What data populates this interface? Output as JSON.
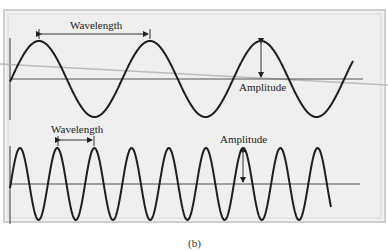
{
  "figure": {
    "caption": "(b)",
    "background": "#ffffff",
    "panel_fill": "#efefef",
    "frame_color": "#c8c8c8",
    "wave_color": "#1e1e1e",
    "baseline_color": "#555555"
  },
  "top_wave": {
    "wavelength_label": "Wavelength",
    "amplitude_label": "Amplitude",
    "baseline_y": 79,
    "amplitude_px": 38,
    "period_px": 111,
    "start_x": 10,
    "end_x": 353,
    "phase_peak_x": 39
  },
  "bottom_wave": {
    "wavelength_label": "Wavelength",
    "amplitude_label": "Amplitude",
    "baseline_y": 184,
    "amplitude_px": 36,
    "period_px": 37.2,
    "start_x": 10,
    "end_x": 331,
    "phase_peak_x": 20
  },
  "chart_data": {
    "type": "line",
    "series": [
      {
        "name": "Long wavelength wave",
        "wavelength_px": 111,
        "amplitude_px": 38,
        "cycles_shown": 3
      },
      {
        "name": "Short wavelength wave",
        "wavelength_px": 37,
        "amplitude_px": 36,
        "cycles_shown": 8.5
      }
    ],
    "annotations": [
      "Wavelength",
      "Amplitude",
      "Wavelength",
      "Amplitude"
    ],
    "caption": "(b)"
  }
}
